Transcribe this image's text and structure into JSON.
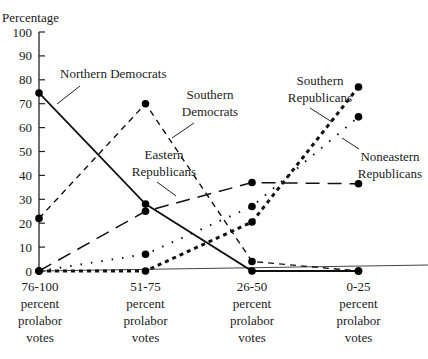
{
  "chart_data": {
    "type": "line",
    "title": "",
    "ylabel": "Percentage",
    "xlabel": "",
    "ylim": [
      0,
      100
    ],
    "yticks": [
      0,
      10,
      20,
      30,
      40,
      50,
      60,
      70,
      80,
      90,
      100
    ],
    "grid": false,
    "legend": "inline labels with leader lines",
    "categories": [
      [
        "76-100",
        "percent",
        "prolabor",
        "votes"
      ],
      [
        "51-75",
        "percent",
        "prolabor",
        "votes"
      ],
      [
        "26-50",
        "percent",
        "prolabor",
        "votes"
      ],
      [
        "0-25",
        "percent",
        "prolabor",
        "votes"
      ]
    ],
    "series": [
      {
        "name": "Northern Democrats",
        "style": "solid",
        "values": [
          74.5,
          28,
          0,
          0
        ]
      },
      {
        "name": "Southern Democrats",
        "style": "dashed",
        "values": [
          22,
          70,
          4,
          0
        ]
      },
      {
        "name": "Eastern Republicans",
        "style": "long-dashed",
        "values": [
          0,
          25,
          37,
          36.5
        ]
      },
      {
        "name": "Southern Republicans",
        "style": "heavy-dotted",
        "values": [
          0,
          0,
          20.5,
          77
        ]
      },
      {
        "name": "Noneastern Republicans",
        "style": "dotted",
        "values": [
          0,
          7,
          27,
          64.5
        ]
      }
    ],
    "labels": {
      "northern_democrats": "Northern Democrats",
      "southern_democrats": [
        "Southern",
        "Democrats"
      ],
      "eastern_republicans": [
        "Eastern",
        "Republicans"
      ],
      "southern_republicans": [
        "Southern",
        "Republicans"
      ],
      "noneastern_republicans": [
        "Noneastern",
        "Republicans"
      ]
    }
  }
}
